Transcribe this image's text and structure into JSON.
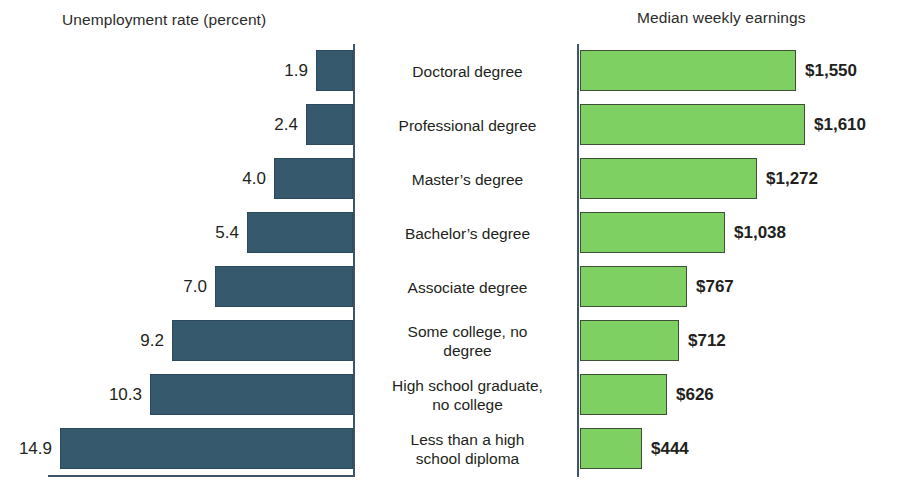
{
  "chart_data": {
    "type": "bar",
    "orientation": "horizontal",
    "layout": "back-to-back paired bars with centered category labels",
    "categories": [
      "Doctoral degree",
      "Professional degree",
      "Master's degree",
      "Bachelor's degree",
      "Associate degree",
      "Some college, no degree",
      "High school graduate, no college",
      "Less than a high school diploma"
    ],
    "series": [
      {
        "name": "Unemployment rate (percent)",
        "side": "left",
        "direction": "right-to-left",
        "color": "#36596e",
        "unit": "percent",
        "values": [
          1.9,
          2.4,
          4.0,
          5.4,
          7.0,
          9.2,
          10.3,
          14.9
        ],
        "labels": [
          "1.9",
          "2.4",
          "4.0",
          "5.4",
          "7.0",
          "9.2",
          "10.3",
          "14.9"
        ],
        "axis_max": 15.5
      },
      {
        "name": "Median weekly earnings",
        "side": "right",
        "direction": "left-to-right",
        "color": "#7ed063",
        "unit": "USD",
        "values": [
          1550,
          1610,
          1272,
          1038,
          767,
          712,
          626,
          444
        ],
        "labels": [
          "$1,550",
          "$1,610",
          "$1,272",
          "$1,038",
          "$767",
          "$712",
          "$626",
          "$444"
        ],
        "axis_max": 1850
      }
    ],
    "grid": false,
    "legend": false
  },
  "titles": {
    "left": "Unemployment rate (percent)",
    "right": "Median weekly earnings"
  },
  "rows": [
    {
      "category": "Doctoral degree",
      "category_line1": "Doctoral degree",
      "category_line2": "",
      "unemployment_label": "1.9",
      "earnings_label": "$1,550"
    },
    {
      "category": "Professional degree",
      "category_line1": "Professional degree",
      "category_line2": "",
      "unemployment_label": "2.4",
      "earnings_label": "$1,610"
    },
    {
      "category": "Master's degree",
      "category_line1": "Master’s degree",
      "category_line2": "",
      "unemployment_label": "4.0",
      "earnings_label": "$1,272"
    },
    {
      "category": "Bachelor's degree",
      "category_line1": "Bachelor’s degree",
      "category_line2": "",
      "unemployment_label": "5.4",
      "earnings_label": "$1,038"
    },
    {
      "category": "Associate degree",
      "category_line1": "Associate degree",
      "category_line2": "",
      "unemployment_label": "7.0",
      "earnings_label": "$767"
    },
    {
      "category": "Some college, no degree",
      "category_line1": "Some college, no",
      "category_line2": "degree",
      "unemployment_label": "9.2",
      "earnings_label": "$712"
    },
    {
      "category": "High school graduate, no college",
      "category_line1": "High school graduate,",
      "category_line2": "no college",
      "unemployment_label": "10.3",
      "earnings_label": "$626"
    },
    {
      "category": "Less than a high school diploma",
      "category_line1": "Less than a high",
      "category_line2": "school diploma",
      "unemployment_label": "14.9",
      "earnings_label": "$444"
    }
  ],
  "colors": {
    "unemployment_bar": "#36596e",
    "unemployment_bar_border": "#2c4a5c",
    "earnings_bar": "#7ed063",
    "earnings_bar_border": "#3f4f36",
    "axis": "#3d5566",
    "text": "#231f20",
    "background": "#ffffff"
  }
}
